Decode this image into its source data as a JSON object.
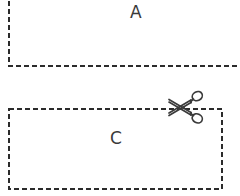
{
  "diagram": {
    "type": "cut-line-diagram",
    "background_color": "#ffffff",
    "stroke_color": "#2b2b2b",
    "label_color": "#3a3a3a",
    "dash_pattern": "5,3",
    "stroke_width": 2,
    "regions": [
      {
        "id": "box-a",
        "label": "A",
        "outline": "dashed",
        "x": 8,
        "y": -18,
        "width": 248,
        "height": 85,
        "clipped_right": true,
        "label_x": 130,
        "label_y": 4
      },
      {
        "id": "box-c",
        "label": "C",
        "outline": "dashed",
        "x": 8,
        "y": 108,
        "width": 214,
        "height": 82,
        "clipped_right": false,
        "label_x": 110,
        "label_y": 130
      }
    ],
    "icons": [
      {
        "id": "scissors",
        "name": "scissors-icon",
        "x": 166,
        "y": 88,
        "width": 42,
        "height": 38,
        "color": "#3b3b3b",
        "on_edge_of": "box-c",
        "edge": "top"
      }
    ]
  }
}
